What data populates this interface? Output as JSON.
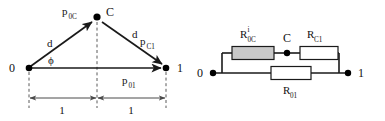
{
  "figure": {
    "type": "two-panel-diagram",
    "background_color": "#ffffff",
    "ink_color": "#111111",
    "shaded_resistor_fill": "#c9c9c9"
  },
  "left_panel": {
    "name": "geometry-triangle",
    "nodes": [
      {
        "id": "n0",
        "label": "0",
        "x": 29,
        "y": 68
      },
      {
        "id": "nC",
        "label": "C",
        "x": 97,
        "y": 17
      },
      {
        "id": "n1",
        "label": "1",
        "x": 166,
        "y": 68
      }
    ],
    "node_labels": {
      "zero": "0",
      "c": "C",
      "one": "1"
    },
    "vectors": [
      {
        "name": "p0C",
        "base": "p",
        "sub": "0C",
        "from": "n0",
        "to": "nC"
      },
      {
        "name": "pC1",
        "base": "p",
        "sub": "C1",
        "from": "nC",
        "to": "n1"
      },
      {
        "name": "p01",
        "base": "p",
        "sub": "01",
        "from": "n0",
        "to": "n1"
      }
    ],
    "edge_labels": {
      "left_d": "d",
      "right_d": "d",
      "angle": "ϕ"
    },
    "dimensions": [
      {
        "name": "left-span",
        "label": "1"
      },
      {
        "name": "right-span",
        "label": "1"
      }
    ]
  },
  "right_panel": {
    "name": "resistor-network",
    "nodes": [
      {
        "id": "r0",
        "label": "0"
      },
      {
        "id": "rC",
        "label": "C"
      },
      {
        "id": "r1",
        "label": "1"
      }
    ],
    "resistors": [
      {
        "name": "R0C",
        "base": "R",
        "sub": "0C",
        "sup": "i",
        "fill": "shaded",
        "branch": "top-left"
      },
      {
        "name": "RC1",
        "base": "R",
        "sub": "C1",
        "sup": "",
        "fill": "open",
        "branch": "top-right"
      },
      {
        "name": "R01",
        "base": "R",
        "sub": "01",
        "sup": "",
        "fill": "open",
        "branch": "bottom"
      }
    ]
  }
}
